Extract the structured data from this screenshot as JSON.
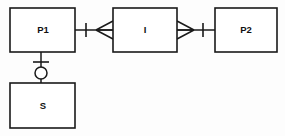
{
  "diagram": {
    "type": "entity-relationship-diagram",
    "notation": "crow's foot",
    "canvas": {
      "width": 285,
      "height": 136,
      "background": "#fdfdfd"
    },
    "line_color": "#1a1a1a",
    "fill_color": "#ffffff",
    "entities": [
      {
        "id": "p1",
        "label": "P1",
        "x": 10,
        "y": 8,
        "width": 65,
        "height": 44,
        "label_x": 43,
        "label_y": 30
      },
      {
        "id": "i",
        "label": "I",
        "x": 113,
        "y": 8,
        "width": 64,
        "height": 44,
        "label_x": 145,
        "label_y": 30
      },
      {
        "id": "p2",
        "label": "P2",
        "x": 215,
        "y": 8,
        "width": 62,
        "height": 44,
        "label_x": 246,
        "label_y": 30
      },
      {
        "id": "s",
        "label": "S",
        "x": 10,
        "y": 83,
        "width": 65,
        "height": 45,
        "label_x": 43,
        "label_y": 106
      }
    ],
    "connections": [
      {
        "id": "p1-i",
        "from": "P1",
        "to": "I",
        "orientation": "horizontal",
        "y": 30,
        "x_start": 75,
        "x_end": 113,
        "from_cardinality": "one",
        "to_cardinality": "many",
        "tick_x": 86,
        "crow_tip_x": 96,
        "crow_base_x": 113
      },
      {
        "id": "i-p2",
        "from": "I",
        "to": "P2",
        "orientation": "horizontal",
        "y": 30,
        "x_start": 177,
        "x_end": 215,
        "from_cardinality": "many",
        "to_cardinality": "one",
        "tick_x": 203,
        "crow_tip_x": 194,
        "crow_base_x": 177
      },
      {
        "id": "p1-s",
        "from": "P1",
        "to": "S",
        "orientation": "vertical",
        "x": 41,
        "y_start": 52,
        "y_end": 83,
        "from_cardinality": "one",
        "to_cardinality": "zero-or-optional",
        "tick_y": 62,
        "circle_cy": 73,
        "circle_r": 6
      }
    ],
    "symbols": {
      "one": "single-tick-mark",
      "many": "crow-foot-fork",
      "optional": "circle"
    }
  }
}
